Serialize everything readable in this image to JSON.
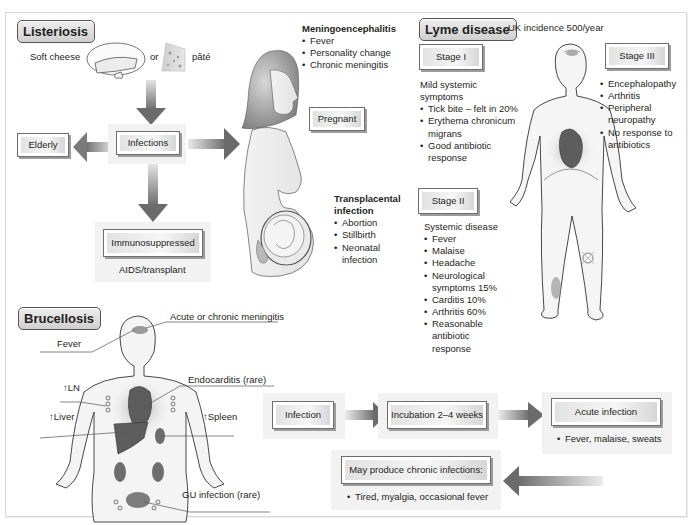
{
  "listeriosis": {
    "title": "Listeriosis",
    "sources": {
      "soft_cheese": "Soft cheese",
      "or": "or",
      "pate": "pâté"
    },
    "center_box": "Infections",
    "left_box": "Elderly",
    "bottom_box": "Immunosuppressed",
    "bottom_caption": "AIDS/transplant",
    "right_box": "Pregnant",
    "meningoencephalitis": {
      "heading": "Meningoencephalitis",
      "items": [
        "Fever",
        "Personality change",
        "Chronic meningitis"
      ]
    },
    "transplacental": {
      "heading_line1": "Transplacental",
      "heading_line2": "infection",
      "items": [
        "Abortion",
        "Stillbirth",
        "Neonatal infection"
      ]
    }
  },
  "lyme": {
    "title": "Lyme disease",
    "incidence": "UK incidence 500/year",
    "stage1": {
      "label": "Stage I",
      "intro_line1": "Mild systemic",
      "intro_line2": "symptoms",
      "items": [
        "Tick bite – felt in 20%",
        "Erythema chronicum migrans",
        "Good antibiotic response"
      ]
    },
    "stage2": {
      "label": "Stage II",
      "intro": "Systemic disease",
      "items": [
        "Fever",
        "Malaise",
        "Headache",
        "Neurological symptoms 15%",
        "Carditis 10%",
        "Arthritis 60%",
        "Reasonable antibiotic response"
      ]
    },
    "stage3": {
      "label": "Stage III",
      "items": [
        "Encephalopathy",
        "Arthritis",
        "Peripheral neuropathy",
        "No response to antibiotics"
      ]
    }
  },
  "brucellosis": {
    "title": "Brucellosis",
    "labels": {
      "meningitis": "Acute or chronic meningitis",
      "fever": "Fever",
      "endocarditis": "Endocarditis (rare)",
      "ln": "↑LN",
      "liver": "↑Liver",
      "spleen": "↑Spleen",
      "gu": "GU infection (rare)"
    },
    "flow": {
      "step1": "Infection",
      "step2": "Incubation 2–4 weeks",
      "step3": "Acute infection",
      "step3_note": "Fever, malaise, sweats",
      "step4": "May produce chronic infections:",
      "step4_note": "Tired, myalgia, occasional fever"
    }
  },
  "colors": {
    "border": "#6d6d6d",
    "box_shadow": "#9c9c9c",
    "arrow_dark": "#6b6b6b",
    "arrow_light": "#dcdcdc",
    "organ": "#5d5d5d",
    "body_fill": "#f4f4f4"
  }
}
